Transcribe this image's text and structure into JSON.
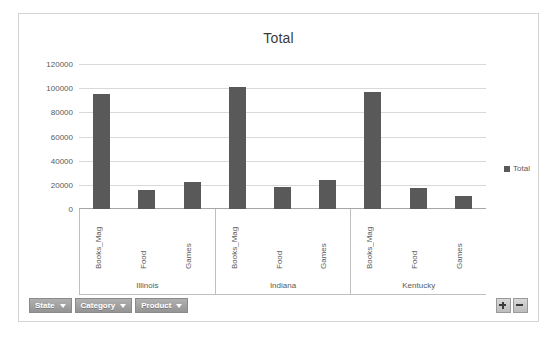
{
  "chart_data": {
    "type": "bar",
    "title": "Total",
    "xlabel": "",
    "ylabel": "",
    "ylim": [
      0,
      120000
    ],
    "ytick_labels": [
      "120000",
      "100000",
      "80000",
      "60000",
      "40000",
      "20000",
      "0"
    ],
    "ytick_values": [
      120000,
      100000,
      80000,
      60000,
      40000,
      20000,
      0
    ],
    "grid": true,
    "legend_position": "right",
    "legend": [
      "Total"
    ],
    "group_field": "State",
    "category_field": "Product",
    "groups": [
      {
        "label": "Illinois",
        "categories": [
          "Books_Mag",
          "Food",
          "Games"
        ],
        "values": [
          95000,
          15500,
          22000
        ]
      },
      {
        "label": "Indiana",
        "categories": [
          "Books_Mag",
          "Food",
          "Games"
        ],
        "values": [
          101000,
          18500,
          24000
        ]
      },
      {
        "label": "Kentucky",
        "categories": [
          "Books_Mag",
          "Food",
          "Games"
        ],
        "values": [
          97000,
          17500,
          10500
        ]
      }
    ],
    "series": [
      {
        "name": "Total",
        "values": [
          95000,
          15500,
          22000,
          101000,
          18500,
          24000,
          97000,
          17500,
          10500
        ]
      }
    ],
    "categories_flat": [
      "Illinois / Books_Mag",
      "Illinois / Food",
      "Illinois / Games",
      "Indiana / Books_Mag",
      "Indiana / Food",
      "Indiana / Games",
      "Kentucky / Books_Mag",
      "Kentucky / Food",
      "Kentucky / Games"
    ],
    "colors": {
      "bar": "#595959",
      "gridline": "#d9d9d9",
      "axis": "#a6a6a6",
      "text": "#595959",
      "title": "#3b3b3b",
      "frame": "#d4d4d4"
    }
  },
  "legend": {
    "items": [
      {
        "label": "Total",
        "color": "#595959"
      }
    ]
  },
  "field_buttons": [
    {
      "label": "State"
    },
    {
      "label": "Category"
    },
    {
      "label": "Product"
    }
  ],
  "expand_collapse": {
    "expand_label": "+",
    "collapse_label": "−"
  }
}
